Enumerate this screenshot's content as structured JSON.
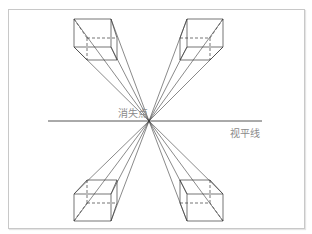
{
  "diagram": {
    "type": "perspective",
    "title": "",
    "labels": {
      "vanishing_point": "消失点",
      "horizon_line": "视平线"
    },
    "colors": {
      "line": "#3a3a3a",
      "label": "#8a8a8a",
      "frame": "#c8c8c8"
    },
    "vanishing_point": [
      149,
      121
    ],
    "horizon": {
      "x1": 48,
      "x2": 262,
      "y": 121
    },
    "boxes": [
      {
        "name": "top-left",
        "front": [
          74,
          19,
          111,
          47
        ],
        "back": [
          87,
          38,
          117,
          60
        ]
      },
      {
        "name": "top-right",
        "front": [
          187,
          19,
          223,
          47
        ],
        "back": [
          180,
          38,
          210,
          60
        ]
      },
      {
        "name": "bottom-left",
        "front": [
          74,
          194,
          111,
          221
        ],
        "back": [
          87,
          180,
          117,
          203
        ]
      },
      {
        "name": "bottom-right",
        "front": [
          187,
          194,
          223,
          221
        ],
        "back": [
          180,
          180,
          210,
          203
        ]
      }
    ]
  }
}
